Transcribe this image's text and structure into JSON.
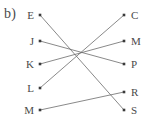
{
  "figure": {
    "part_label": "b)",
    "width": 154,
    "height": 122,
    "line_color": "#6b6b6b",
    "dot_color": "#3a3a3a",
    "text_color": "#4a4a4a",
    "background": "#ffffff"
  },
  "left_column": {
    "x": 40,
    "label_offset_x": -6,
    "nodes": [
      {
        "id": "E",
        "label": "E",
        "y": 15
      },
      {
        "id": "J",
        "label": "J",
        "y": 41
      },
      {
        "id": "K",
        "label": "K",
        "y": 64
      },
      {
        "id": "L",
        "label": "L",
        "y": 88
      },
      {
        "id": "M",
        "label": "M",
        "y": 110
      }
    ]
  },
  "right_column": {
    "x": 124,
    "label_offset_x": 7,
    "nodes": [
      {
        "id": "C",
        "label": "C",
        "y": 15
      },
      {
        "id": "M",
        "label": "M",
        "y": 41
      },
      {
        "id": "P",
        "label": "P",
        "y": 64
      },
      {
        "id": "R",
        "label": "R",
        "y": 92
      },
      {
        "id": "S",
        "label": "S",
        "y": 110
      }
    ]
  },
  "edges": [
    {
      "from": "E",
      "to": "S",
      "x1": 40,
      "y1": 15,
      "x2": 124,
      "y2": 110
    },
    {
      "from": "J",
      "to": "P",
      "x1": 40,
      "y1": 41,
      "x2": 124,
      "y2": 64
    },
    {
      "from": "K",
      "to": "M",
      "x1": 40,
      "y1": 64,
      "x2": 124,
      "y2": 41
    },
    {
      "from": "L",
      "to": "C",
      "x1": 40,
      "y1": 88,
      "x2": 124,
      "y2": 15
    },
    {
      "from": "M",
      "to": "R",
      "x1": 40,
      "y1": 110,
      "x2": 124,
      "y2": 92
    }
  ]
}
